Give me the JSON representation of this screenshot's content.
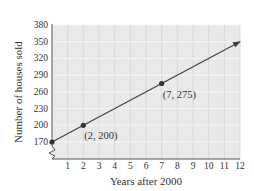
{
  "chart_data": {
    "type": "line",
    "title": "",
    "xlabel": "Years after 2000",
    "ylabel": "Number of houses sold",
    "x_ticks": [
      1,
      2,
      3,
      4,
      5,
      6,
      7,
      8,
      9,
      10,
      11,
      12
    ],
    "y_ticks": [
      170,
      200,
      230,
      260,
      290,
      320,
      350,
      380
    ],
    "xlim": [
      0,
      12
    ],
    "ylim": [
      170,
      380
    ],
    "y_axis_break": true,
    "grid": true,
    "series": [
      {
        "name": "Houses sold",
        "line": {
          "from": [
            0,
            170
          ],
          "to": [
            12,
            350
          ],
          "arrow_end": true
        },
        "points": [
          {
            "x": 0,
            "y": 170,
            "label": ""
          },
          {
            "x": 2,
            "y": 200,
            "label": "(2, 200)"
          },
          {
            "x": 7,
            "y": 275,
            "label": "(7, 275)"
          }
        ]
      }
    ],
    "colors": {
      "plot_background": "#e9e9e9",
      "grid": "#f7f7f7",
      "axis": "#555555",
      "line": "#444444",
      "point": "#333333"
    }
  }
}
